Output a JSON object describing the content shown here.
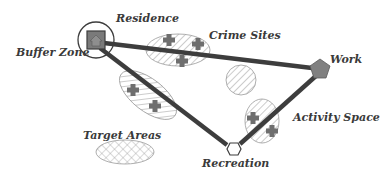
{
  "labels": {
    "residence": "Residence",
    "buffer_zone": "Buffer Zone",
    "crime_sites": "Crime Sites",
    "work": "Work",
    "activity_space": "Activity Space",
    "target_areas": "Target Areas",
    "recreation": "Recreation"
  },
  "nodes": [
    {
      "id": "residence",
      "shape": "square-house",
      "x": 96,
      "y": 40
    },
    {
      "id": "work",
      "shape": "pentagon",
      "x": 320,
      "y": 69
    },
    {
      "id": "recreation",
      "shape": "hexagon",
      "x": 233,
      "y": 149
    }
  ],
  "paths": [
    {
      "from": "residence",
      "to": "work"
    },
    {
      "from": "residence",
      "to": "recreation"
    },
    {
      "from": "recreation",
      "to": "work"
    }
  ],
  "areas": [
    {
      "name": "crime-sites-area",
      "type": "ellipse",
      "cx": 178,
      "cy": 50,
      "rx": 32,
      "ry": 16,
      "pattern": "diagonal-hatch"
    },
    {
      "name": "path-area-left",
      "type": "ellipse",
      "cx": 148,
      "cy": 95,
      "rx": 34,
      "ry": 16,
      "rotate": 38,
      "pattern": "diagonal-hatch"
    },
    {
      "name": "isolated-area",
      "type": "circle",
      "cx": 241,
      "cy": 80,
      "r": 15,
      "pattern": "diagonal-hatch"
    },
    {
      "name": "activity-space-area",
      "type": "ellipse",
      "cx": 262,
      "cy": 121,
      "rx": 17,
      "ry": 22,
      "pattern": "diagonal-hatch"
    },
    {
      "name": "target-area",
      "type": "ellipse",
      "cx": 125,
      "cy": 152,
      "rx": 29,
      "ry": 12,
      "pattern": "cross-hatch"
    }
  ],
  "crime_markers": [
    {
      "x": 169,
      "y": 40
    },
    {
      "x": 198,
      "y": 44
    },
    {
      "x": 182,
      "y": 61
    },
    {
      "x": 133,
      "y": 90
    },
    {
      "x": 155,
      "y": 106
    },
    {
      "x": 253,
      "y": 118
    },
    {
      "x": 272,
      "y": 131
    }
  ],
  "buffer_zone": {
    "cx": 96,
    "cy": 40,
    "r": 18
  },
  "colors": {
    "line": "#3d3d3d",
    "marker": "#6e6e6e",
    "node_fill": "#808080",
    "hatch": "#9a9a9a",
    "text": "#3a3a3a"
  }
}
